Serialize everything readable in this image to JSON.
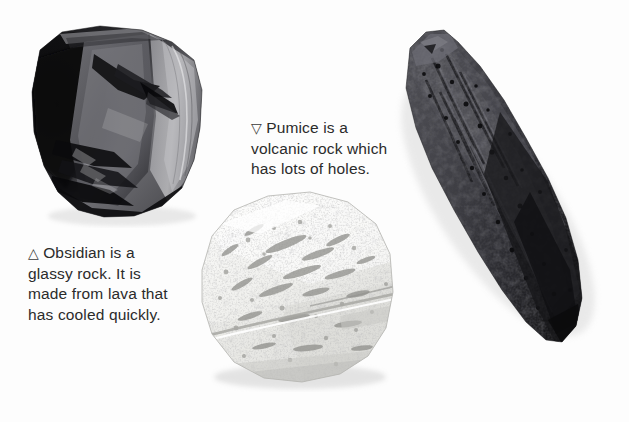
{
  "page": {
    "type": "textbook-figure-page",
    "background_color": "#fdfdfd",
    "width": 629,
    "height": 422
  },
  "captions": {
    "obsidian": {
      "marker_icon": "triangle-up-outline-icon",
      "marker_glyph": "△",
      "text": "Obsidian is a\nglassy rock. It is\nmade from lava that\nhas cooled quickly.",
      "color": "#2b2b2b"
    },
    "pumice": {
      "marker_icon": "triangle-down-outline-icon",
      "marker_glyph": "▽",
      "text": "Pumice is a\nvolcanic rock which\nhas lots of holes.",
      "color": "#2b2b2b"
    }
  },
  "specimens": [
    {
      "id": "obsidian",
      "name": "obsidian-rock-photo",
      "label": "Obsidian",
      "description": "Dark angular glassy rock with conchoidal fracture surfaces",
      "colors": {
        "darkest": "#070707",
        "dark": "#1d1d1f",
        "mid": "#4a4a4d",
        "light": "#8d8d90",
        "highlight": "#b9b9bb"
      }
    },
    {
      "id": "pumice",
      "name": "pumice-rock-photo",
      "label": "Pumice",
      "description": "Pale white porous rock covered in many small holes",
      "colors": {
        "base": "#f4f4f2",
        "shade": "#dcdcd8",
        "pore": "#9c9c98",
        "deep": "#76767a",
        "highlight": "#ffffff"
      }
    },
    {
      "id": "scoria",
      "name": "scoria-lava-rock-photo",
      "label": "",
      "description": "Elongated dark grey lava bomb with ropey ridged surface",
      "colors": {
        "darkest": "#101012",
        "dark": "#26262a",
        "mid": "#44444a",
        "light": "#5e5e64",
        "highlight": "#78787e"
      }
    }
  ]
}
